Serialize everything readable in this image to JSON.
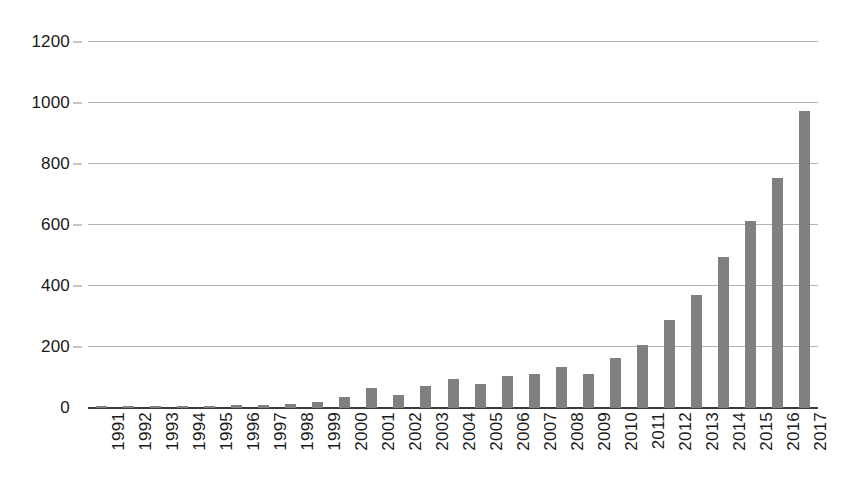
{
  "chart_data": {
    "type": "bar",
    "title": "",
    "subtitle": "",
    "xlabel": "",
    "ylabel": "",
    "categories": [
      "1991",
      "1992",
      "1993",
      "1994",
      "1995",
      "1996",
      "1997",
      "1998",
      "1999",
      "2000",
      "2001",
      "2002",
      "2003",
      "2004",
      "2005",
      "2006",
      "2007",
      "2008",
      "2009",
      "2010",
      "2011",
      "2012",
      "2013",
      "2014",
      "2015",
      "2016",
      "2017"
    ],
    "values": [
      6,
      6,
      5,
      6,
      5,
      11,
      10,
      14,
      20,
      36,
      64,
      44,
      71,
      95,
      80,
      105,
      110,
      133,
      110,
      163,
      205,
      288,
      370,
      495,
      612,
      753,
      975
    ],
    "series": [
      {
        "name": "Publications",
        "values": [
          6,
          6,
          5,
          6,
          5,
          11,
          10,
          14,
          20,
          36,
          64,
          44,
          71,
          95,
          80,
          105,
          110,
          133,
          110,
          163,
          205,
          288,
          370,
          495,
          612,
          753,
          975
        ]
      }
    ],
    "ylim": [
      0,
      1200
    ],
    "y_ticks": [
      0,
      200,
      400,
      600,
      800,
      1000,
      1200
    ],
    "y_tick_labels": [
      "0",
      "200",
      "400",
      "600",
      "800",
      "1000",
      "1200"
    ],
    "grid": true,
    "grid_axis": "y",
    "legend": false,
    "legend_position": "none",
    "bar_color": "#808080",
    "gridline_color": "#b4b4b4",
    "axis_color": "#3c3c3c",
    "text_color": "#1a1a1a",
    "x_tick_rotation": -90
  }
}
